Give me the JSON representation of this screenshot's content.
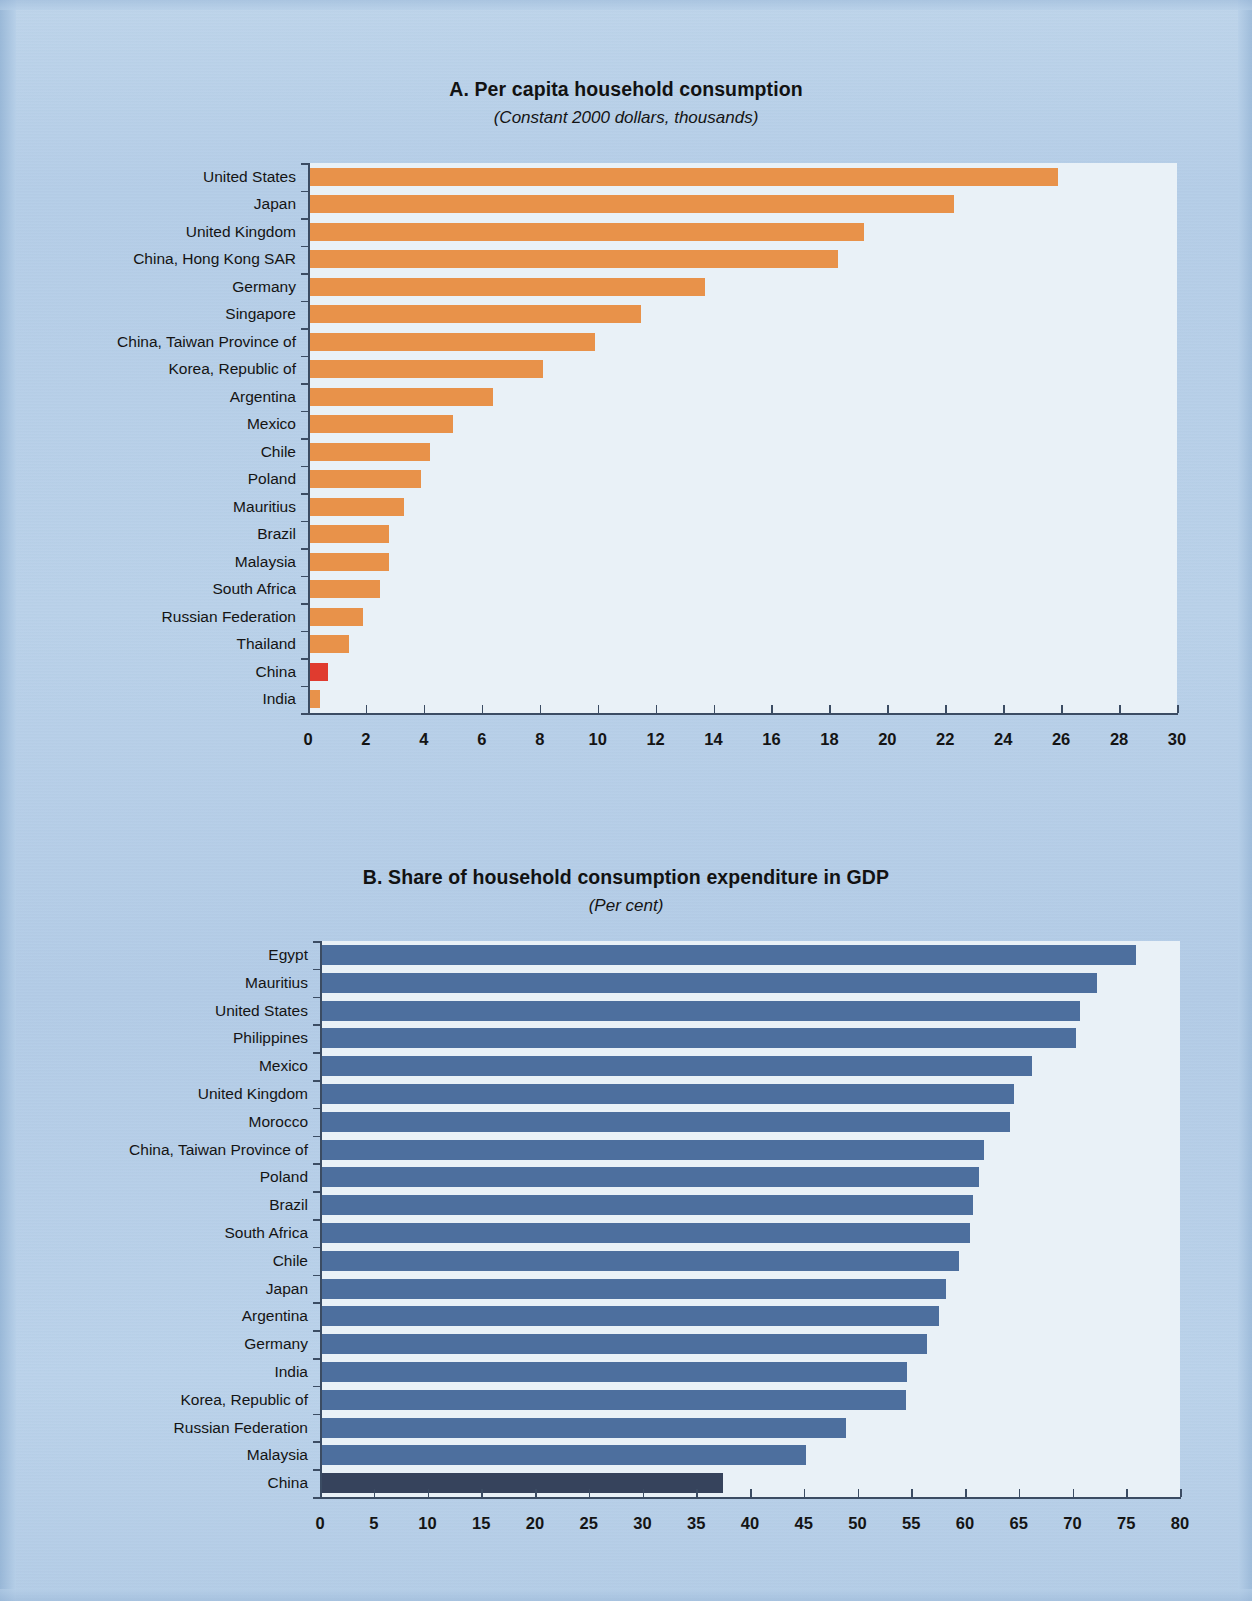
{
  "page": {
    "background_color": "#b6cfe8"
  },
  "panel_a": {
    "title": "A. Per capita household consumption",
    "subtitle": "(Constant 2000 dollars, thousands)"
  },
  "panel_b": {
    "title": "B. Share of household consumption expenditure in GDP",
    "subtitle": "(Per cent)"
  },
  "chart_data": [
    {
      "type": "bar",
      "orientation": "horizontal",
      "title": "A. Per capita household consumption",
      "subtitle": "(Constant 2000 dollars, thousands)",
      "xlabel": "",
      "ylabel": "",
      "xlim": [
        0,
        30
      ],
      "xticks": [
        0,
        2,
        4,
        6,
        8,
        10,
        12,
        14,
        16,
        18,
        20,
        22,
        24,
        26,
        28,
        30
      ],
      "grid": false,
      "legend": "none",
      "bar_color": "#e8924a",
      "highlight_color": "#e03b2f",
      "highlight_category": "China",
      "plot_background": "#e9f1f7",
      "categories": [
        "United States",
        "Japan",
        "United Kingdom",
        "China, Hong Kong SAR",
        "Germany",
        "Singapore",
        "China, Taiwan Province of",
        "Korea, Republic of",
        "Argentina",
        "Mexico",
        "Chile",
        "Poland",
        "Mauritius",
        "Brazil",
        "Malaysia",
        "South Africa",
        "Russian Federation",
        "Thailand",
        "China",
        "India"
      ],
      "values": [
        25.9,
        22.3,
        19.2,
        18.3,
        13.7,
        11.5,
        9.9,
        8.1,
        6.4,
        5.0,
        4.2,
        3.9,
        3.3,
        2.8,
        2.8,
        2.5,
        1.9,
        1.4,
        0.7,
        0.4
      ]
    },
    {
      "type": "bar",
      "orientation": "horizontal",
      "title": "B. Share of household consumption expenditure in GDP",
      "subtitle": "(Per cent)",
      "xlabel": "",
      "ylabel": "",
      "xlim": [
        0,
        80
      ],
      "xticks": [
        0,
        5,
        10,
        15,
        20,
        25,
        30,
        35,
        40,
        45,
        50,
        55,
        60,
        65,
        70,
        75,
        80
      ],
      "grid": false,
      "legend": "none",
      "bar_color": "#4d6f9e",
      "highlight_color": "#36435c",
      "highlight_category": "China",
      "plot_background": "#e9f1f7",
      "categories": [
        "Egypt",
        "Mauritius",
        "United States",
        "Philippines",
        "Mexico",
        "United Kingdom",
        "Morocco",
        "China, Taiwan Province of",
        "Poland",
        "Brazil",
        "South Africa",
        "Chile",
        "Japan",
        "Argentina",
        "Germany",
        "India",
        "Korea, Republic of",
        "Russian Federation",
        "Malaysia",
        "China"
      ],
      "values": [
        75.9,
        72.3,
        70.7,
        70.3,
        66.2,
        64.6,
        64.2,
        61.8,
        61.3,
        60.7,
        60.5,
        59.4,
        58.2,
        57.6,
        56.5,
        54.6,
        54.5,
        48.9,
        45.2,
        37.5
      ]
    }
  ]
}
